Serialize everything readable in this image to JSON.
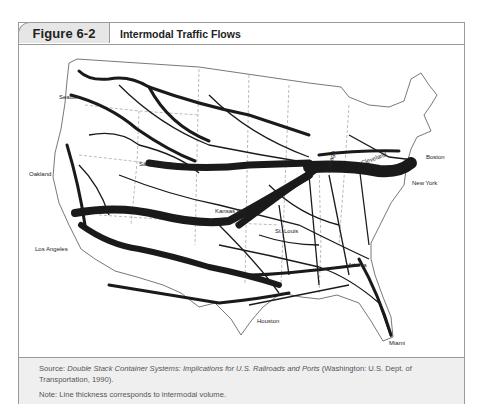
{
  "figure": {
    "number": "Figure 6-2",
    "title": "Intermodal Traffic Flows"
  },
  "map": {
    "description": "Map of the continental United States showing intermodal rail traffic flows; line thickness indicates volume",
    "cities": [
      {
        "name": "Seattle",
        "x": 62,
        "y": 38
      },
      {
        "name": "Oakland",
        "x": 10,
        "y": 133
      },
      {
        "name": "Salt Lake City",
        "x": 123,
        "y": 125
      },
      {
        "name": "Los Angeles",
        "x": 25,
        "y": 205
      },
      {
        "name": "Kansas City",
        "x": 195,
        "y": 167
      },
      {
        "name": "St. Louis",
        "x": 256,
        "y": 186
      },
      {
        "name": "Chicago",
        "x": 312,
        "y": 120
      },
      {
        "name": "Cleveland",
        "x": 345,
        "y": 128
      },
      {
        "name": "Boston",
        "x": 410,
        "y": 112
      },
      {
        "name": "New York",
        "x": 392,
        "y": 136
      },
      {
        "name": "Atlanta",
        "x": 330,
        "y": 221
      },
      {
        "name": "Houston",
        "x": 240,
        "y": 276
      },
      {
        "name": "Miami",
        "x": 372,
        "y": 298
      }
    ],
    "colors": {
      "flow": "#1a1a1a",
      "border": "#555555"
    }
  },
  "footer": {
    "source_prefix": "Source: ",
    "source_title": "Double Stack Container Systems: Implications for U.S. Railroads and Ports",
    "source_suffix": " (Washington: U.S. Dept. of Transportation, 1990).",
    "note": "Note: Line thickness corresponds to intermodal volume."
  }
}
